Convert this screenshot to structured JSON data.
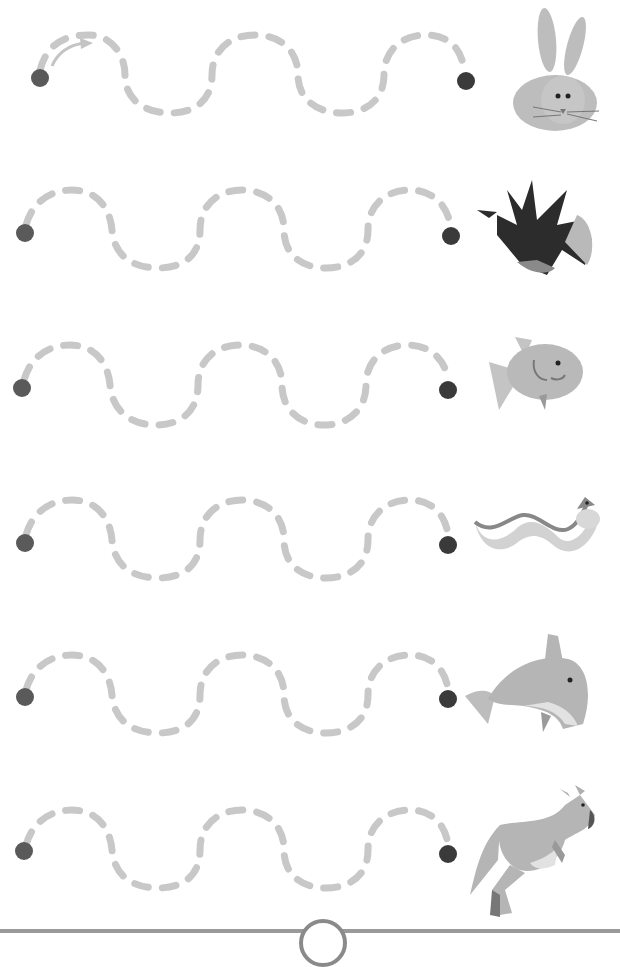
{
  "worksheet": {
    "type": "tracing-wavy-lines",
    "colors": {
      "dash": "#c8c8c8",
      "dot": "#5a5a5a",
      "end_dot": "#3a3a3a",
      "arrow": "#c0c0c0",
      "animal_gray": "#b9b9b9",
      "animal_dark": "#2c2c2c"
    },
    "rows": [
      {
        "animal": "rabbit",
        "has_arrow": true
      },
      {
        "animal": "bird"
      },
      {
        "animal": "fish"
      },
      {
        "animal": "worm"
      },
      {
        "animal": "dolphin"
      },
      {
        "animal": "kangaroo"
      }
    ]
  }
}
